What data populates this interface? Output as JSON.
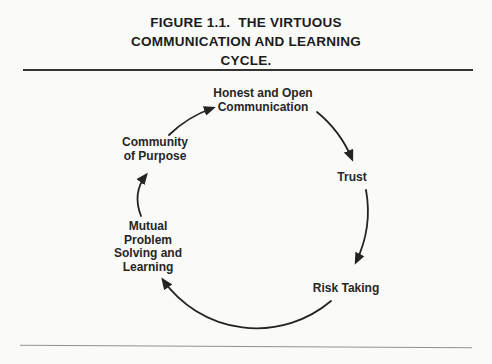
{
  "figure": {
    "title": "FIGURE 1.1.  THE VIRTUOUS\nCOMMUNICATION AND LEARNING\nCYCLE."
  },
  "diagram": {
    "type": "cycle",
    "direction": "clockwise",
    "nodes": [
      {
        "id": "honest-open-communication",
        "label": "Honest and Open\nCommunication"
      },
      {
        "id": "trust",
        "label": "Trust"
      },
      {
        "id": "risk-taking",
        "label": "Risk Taking"
      },
      {
        "id": "mutual-problem-solving-learning",
        "label": "Mutual\nProblem\nSolving and\nLearning"
      },
      {
        "id": "community-of-purpose",
        "label": "Community\nof Purpose"
      }
    ],
    "edges": [
      {
        "from": "community-of-purpose",
        "to": "honest-open-communication"
      },
      {
        "from": "honest-open-communication",
        "to": "trust"
      },
      {
        "from": "trust",
        "to": "risk-taking"
      },
      {
        "from": "risk-taking",
        "to": "mutual-problem-solving-learning"
      },
      {
        "from": "mutual-problem-solving-learning",
        "to": "community-of-purpose"
      }
    ]
  },
  "colors": {
    "paper": "#fafaf8",
    "ink": "#1b1b1b",
    "arc_stroke": "#232323",
    "rule_top": "#333331",
    "rule_bottom": "#91918c"
  }
}
